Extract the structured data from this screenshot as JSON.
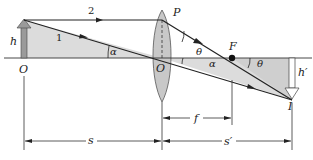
{
  "diagram": {
    "type": "thin-lens-ray-diagram",
    "colors": {
      "background": "#ffffff",
      "ray": "#222222",
      "shading": "#dcdcdc",
      "lens_fill": "#c8c8c8",
      "lens_stroke": "#555555",
      "axis": "#333333"
    },
    "labels": {
      "object_height": "h",
      "object_point": "O",
      "lens_center": "O",
      "lens_top_point": "P",
      "focal_point": "F",
      "image_point": "I",
      "image_height": "h′",
      "ray_1": "1",
      "ray_2": "2",
      "angle_alpha_left": "α",
      "angle_alpha_right": "α",
      "angle_theta_lens": "θ",
      "angle_theta_focus": "θ"
    },
    "dimensions": {
      "object_distance": "s",
      "focal_length": "f",
      "image_distance": "s′"
    }
  }
}
